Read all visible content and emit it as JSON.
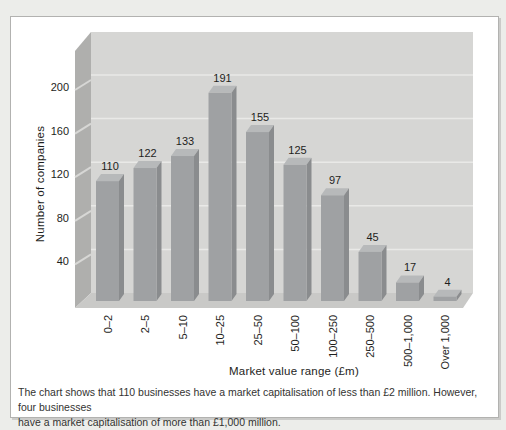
{
  "page": {
    "background": "#ecedea"
  },
  "panel": {
    "background": "#ffffff",
    "border_color": "#b2b2b0"
  },
  "chart_data": {
    "type": "bar",
    "style": "3d-gray",
    "title": "",
    "xlabel": "Market value range (£m)",
    "ylabel": "Number of companies",
    "categories": [
      "0–2",
      "2–5",
      "5–10",
      "10–25",
      "25–50",
      "50–100",
      "100–250",
      "250–500",
      "500–1,000",
      "Over 1,000"
    ],
    "values": [
      110,
      122,
      133,
      191,
      155,
      125,
      97,
      45,
      17,
      4
    ],
    "yticks": [
      40,
      80,
      120,
      160,
      200
    ],
    "ylim": [
      0,
      240
    ],
    "grid": true,
    "value_labels_shown": true,
    "legend": "none",
    "colors": {
      "bar_front": "#9fa1a3",
      "bar_side": "#8a8c8e",
      "bar_top": "#b7b9ba",
      "back_wall": "#d6d6d4",
      "left_wall": "#afafad",
      "wall_notch": "#d7d7d5",
      "floor": "#c9c9c7",
      "gridline": "#e9e9e7",
      "label_text": "#1e1e1c"
    }
  },
  "caption": {
    "lines": [
      "The chart shows that 110 businesses have a market capitalisation of less than £2 million. However, four businesses",
      "have a market capitalisation of more than £1,000 million."
    ]
  }
}
